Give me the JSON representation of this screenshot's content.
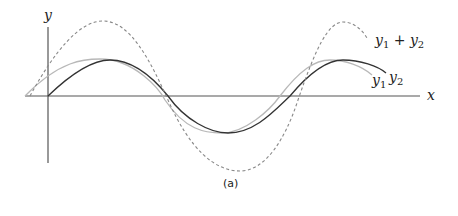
{
  "figure": {
    "caption": "(a)",
    "axes": {
      "x_label": "x",
      "y_label": "y"
    },
    "curves": [
      {
        "name": "y1",
        "label_base": "y",
        "label_sub": "1",
        "style": "solid",
        "color": "#b8b8b8"
      },
      {
        "name": "y2",
        "label_base": "y",
        "label_sub": "2",
        "style": "solid",
        "color": "#333333"
      },
      {
        "name": "y1 + y2",
        "style": "dashed",
        "color": "#888888"
      }
    ],
    "sum_label": {
      "a_base": "y",
      "a_sub": "1",
      "plus": " + ",
      "b_base": "y",
      "b_sub": "2"
    }
  }
}
